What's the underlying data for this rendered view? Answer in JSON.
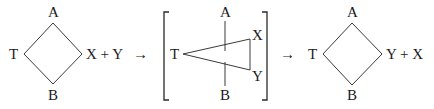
{
  "diagram": {
    "panels": [
      {
        "shape": "diamond",
        "vertices": {
          "top": "A",
          "left": "T",
          "bottom": "B"
        },
        "right_label": "X + Y"
      },
      {
        "shape": "triangle-with-vertical-axis",
        "bracketed": true,
        "labels": {
          "top": "A",
          "left": "T",
          "bottom": "B",
          "upper_right": "X",
          "lower_right": "Y"
        }
      },
      {
        "shape": "diamond",
        "vertices": {
          "top": "A",
          "left": "T",
          "bottom": "B"
        },
        "right_label": "Y + X"
      }
    ],
    "arrows": [
      "→",
      "→"
    ]
  }
}
